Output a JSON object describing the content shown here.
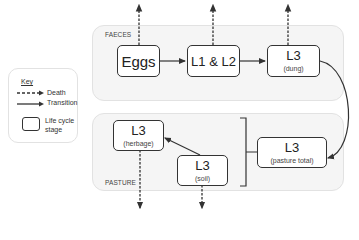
{
  "key": {
    "title": "Key",
    "items": [
      {
        "symbol": "dashed-arrow",
        "label": "Death"
      },
      {
        "symbol": "solid-arrow",
        "label": "Transition"
      },
      {
        "symbol": "rounded-box",
        "label_line1": "Life cycle",
        "label_line2": "stage"
      }
    ]
  },
  "panels": {
    "faeces": {
      "label": "FAECES"
    },
    "pasture": {
      "label": "PASTURE"
    }
  },
  "stages": {
    "eggs": {
      "main": "Eggs",
      "sub": ""
    },
    "l1l2": {
      "main": "L1 & L2",
      "sub": ""
    },
    "l3_dung": {
      "main": "L3",
      "sub": "(dung)"
    },
    "l3_herbage": {
      "main": "L3",
      "sub": "(herbage)"
    },
    "l3_soil": {
      "main": "L3",
      "sub": "(soil)"
    },
    "l3_pasture_total": {
      "main": "L3",
      "sub": "(pasture total)"
    }
  },
  "edges": [
    {
      "from": "eggs",
      "to": "l1l2",
      "type": "transition"
    },
    {
      "from": "l1l2",
      "to": "l3_dung",
      "type": "transition"
    },
    {
      "from": "l3_dung",
      "to": "l3_pasture_total",
      "type": "transition"
    },
    {
      "from": "l3_soil",
      "to": "l3_herbage",
      "type": "transition"
    },
    {
      "from": "eggs",
      "to": "death",
      "type": "death"
    },
    {
      "from": "l1l2",
      "to": "death",
      "type": "death"
    },
    {
      "from": "l3_dung",
      "to": "death",
      "type": "death"
    },
    {
      "from": "l3_herbage",
      "to": "death",
      "type": "death"
    },
    {
      "from": "l3_soil",
      "to": "death",
      "type": "death"
    }
  ],
  "bracket": {
    "groups": [
      "l3_herbage",
      "l3_soil"
    ],
    "total": "l3_pasture_total"
  },
  "colors": {
    "panel_fill": "#f5f5f5",
    "panel_border": "#e2e2e2",
    "line": "#333333"
  }
}
